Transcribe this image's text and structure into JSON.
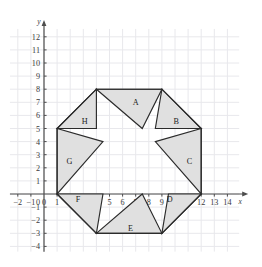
{
  "chart_data": {
    "type": "scatter",
    "title": "",
    "xlabel": "x",
    "ylabel": "y",
    "xlim": [
      -2.6,
      14.9
    ],
    "ylim": [
      -4.4,
      12.6
    ],
    "grid": true,
    "legend": null,
    "xticks": [
      -2,
      -1,
      0,
      1,
      2,
      3,
      4,
      5,
      6,
      7,
      8,
      9,
      10,
      11,
      12,
      13,
      14
    ],
    "yticks": [
      -4,
      -3,
      -2,
      -1,
      1,
      2,
      3,
      4,
      5,
      6,
      7,
      8,
      9,
      10,
      11,
      12
    ],
    "xtick_labels": [
      "-2",
      "-1",
      "0",
      "1",
      "2",
      "3",
      "4",
      "5",
      "6",
      "7",
      "8",
      "9",
      "10",
      "11",
      "12",
      "13",
      "14"
    ],
    "ytick_labels": [
      "-4",
      "-3",
      "-2",
      "-1",
      "1",
      "2",
      "3",
      "4",
      "5",
      "6",
      "7",
      "8",
      "9",
      "10",
      "11",
      "12"
    ],
    "outer_octagon": [
      [
        1,
        0
      ],
      [
        4,
        -3
      ],
      [
        9,
        -3
      ],
      [
        12,
        0
      ],
      [
        12,
        5
      ],
      [
        9,
        8
      ],
      [
        4,
        8
      ],
      [
        1,
        5
      ]
    ],
    "inner_star": [
      [
        4,
        4
      ],
      [
        6.5,
        5
      ],
      [
        8.5,
        4
      ],
      [
        8,
        1.5
      ],
      [
        9,
        -0.6
      ],
      [
        6.5,
        -1
      ],
      [
        4.5,
        0
      ],
      [
        2.8,
        1.4
      ]
    ],
    "shaded_regions": [
      {
        "label": "A",
        "points": [
          [
            4,
            8
          ],
          [
            9,
            8
          ],
          [
            7.5,
            5
          ]
        ],
        "fill": "#e0e0e0"
      },
      {
        "label": "B",
        "points": [
          [
            9,
            8
          ],
          [
            12,
            5
          ],
          [
            8.5,
            5
          ]
        ],
        "fill": "#e0e0e0"
      },
      {
        "label": "C",
        "points": [
          [
            12,
            5
          ],
          [
            12,
            0
          ],
          [
            8.5,
            4
          ]
        ],
        "fill": "#e0e0e0"
      },
      {
        "label": "D",
        "points": [
          [
            12,
            0
          ],
          [
            9,
            -3
          ],
          [
            9.5,
            0
          ]
        ],
        "fill": "#e0e0e0"
      },
      {
        "label": "E",
        "points": [
          [
            9,
            -3
          ],
          [
            4,
            -3
          ],
          [
            7.5,
            0
          ]
        ],
        "fill": "#e0e0e0"
      },
      {
        "label": "F",
        "points": [
          [
            4,
            -3
          ],
          [
            1,
            0
          ],
          [
            4.5,
            0
          ]
        ],
        "fill": "#e0e0e0"
      },
      {
        "label": "G",
        "points": [
          [
            1,
            0
          ],
          [
            1,
            5
          ],
          [
            4.5,
            4
          ]
        ],
        "fill": "#e0e0e0"
      },
      {
        "label": "H",
        "points": [
          [
            1,
            5
          ],
          [
            4,
            8
          ],
          [
            4,
            5
          ]
        ],
        "fill": "#e0e0e0"
      }
    ],
    "region_labels": [
      {
        "text": "A",
        "x": 7.0,
        "y": 7.0
      },
      {
        "text": "B",
        "x": 10.1,
        "y": 5.6
      },
      {
        "text": "C",
        "x": 11.1,
        "y": 2.5
      },
      {
        "text": "D",
        "x": 9.6,
        "y": -0.35
      },
      {
        "text": "E",
        "x": 6.6,
        "y": -2.6
      },
      {
        "text": "F",
        "x": 2.6,
        "y": -0.35
      },
      {
        "text": "G",
        "x": 1.95,
        "y": 2.5
      },
      {
        "text": "H",
        "x": 3.1,
        "y": 5.6
      }
    ],
    "colors": {
      "fill": "#e0e0e0",
      "stroke": "#2b2b2b",
      "grid": "#e8e8ec",
      "axis": "#4d4d4d",
      "text": "#3a3a3a"
    }
  }
}
